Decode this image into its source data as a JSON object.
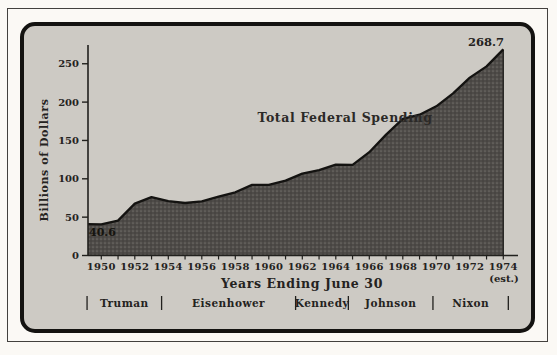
{
  "chart_data": {
    "type": "area",
    "series_label": "Total Federal Spending",
    "ylabel": "Billions of Dollars",
    "xlabel": "Years Ending June 30",
    "x": [
      1950,
      1951,
      1952,
      1953,
      1954,
      1955,
      1956,
      1957,
      1958,
      1959,
      1960,
      1961,
      1962,
      1963,
      1964,
      1965,
      1966,
      1967,
      1968,
      1969,
      1970,
      1971,
      1972,
      1973,
      1974
    ],
    "values": [
      40.6,
      45.5,
      67.7,
      76.1,
      70.9,
      68.4,
      70.6,
      76.6,
      82.4,
      92.1,
      92.2,
      97.7,
      106.8,
      111.3,
      118.5,
      118.2,
      134.7,
      157.6,
      178.1,
      183.6,
      194.5,
      211.4,
      231.9,
      246.5,
      268.7
    ],
    "left_edge_value": 41,
    "ylim": [
      0,
      275
    ],
    "yticks": [
      0,
      50,
      100,
      150,
      200,
      250
    ],
    "xtick_labels": [
      1950,
      1952,
      1954,
      1956,
      1958,
      1960,
      1962,
      1964,
      1966,
      1968,
      1970,
      1972,
      1974
    ],
    "xtick_minor_years": [
      1950,
      1951,
      1952,
      1953,
      1954,
      1955,
      1956,
      1957,
      1958,
      1959,
      1960,
      1961,
      1962,
      1963,
      1964,
      1965,
      1966,
      1967,
      1968,
      1969,
      1970,
      1971,
      1972,
      1973,
      1974
    ],
    "grid": false,
    "legend_position": "inside-top-right-of-curve",
    "annotations": {
      "start_value_label": "40.6",
      "end_value_label": "268.7",
      "estimate_note": "(est.)"
    },
    "presidents": [
      {
        "name": "Truman",
        "from": 1949.15,
        "to": 1953.6
      },
      {
        "name": "Eisenhower",
        "from": 1953.6,
        "to": 1961.6
      },
      {
        "name": "Kennedy",
        "from": 1961.6,
        "to": 1964.75
      },
      {
        "name": "Johnson",
        "from": 1964.75,
        "to": 1969.8
      },
      {
        "name": "Nixon",
        "from": 1969.8,
        "to": 1974.3
      }
    ],
    "colors": {
      "page_bg": "#fbf9f5",
      "panel_bg": "#cdcac4",
      "panel_border": "#141311",
      "area_fill": "#4e4b48",
      "area_dot_light": "#6e6b66",
      "area_dot_dark": "#3c3a37",
      "line": "#141311",
      "axis": "#21201d",
      "text": "#242220"
    }
  }
}
